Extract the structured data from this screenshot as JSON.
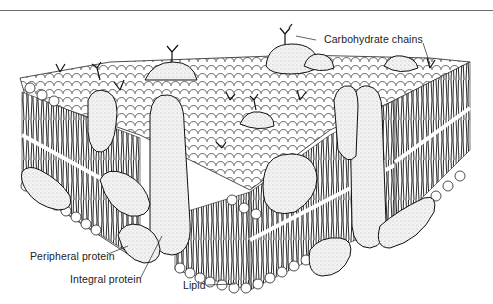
{
  "figure": {
    "labels": {
      "carbohydrate_chains": "Carbohydrate chains",
      "peripheral_protein": "Peripheral protein",
      "integral_protein": "Integral protein",
      "lipid": "Lipid"
    },
    "colors": {
      "ink": "#111111",
      "paper": "#ffffff",
      "rule": "#6a6a6a",
      "protein_fill": "#f1f1f1"
    }
  }
}
